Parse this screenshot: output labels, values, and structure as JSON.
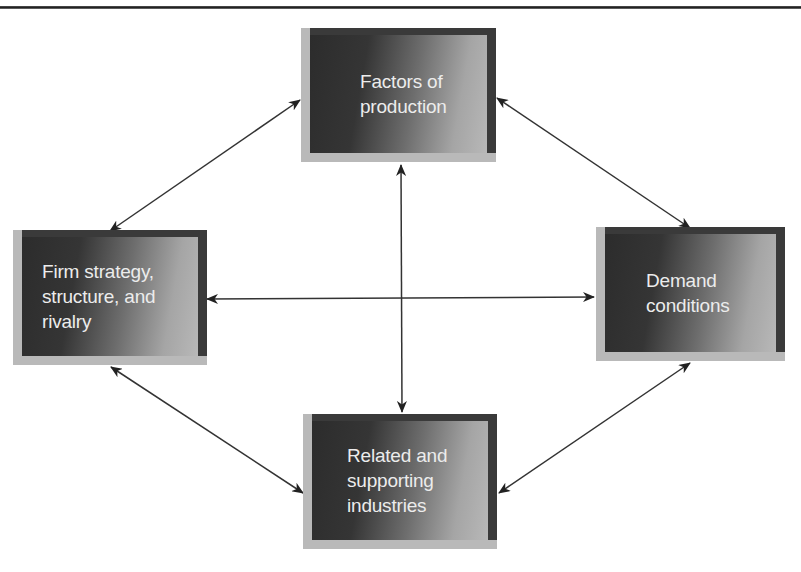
{
  "diagram": {
    "type": "porter-diamond",
    "nodes": [
      {
        "id": "factors",
        "label": "Factors of\nproduction"
      },
      {
        "id": "firm",
        "label": "Firm strategy,\nstructure, and\nrivalry"
      },
      {
        "id": "demand",
        "label": "Demand\nconditions"
      },
      {
        "id": "related",
        "label": "Related and\nsupporting\nindustries"
      }
    ],
    "edges": [
      {
        "from": "factors",
        "to": "firm",
        "bidirectional": true
      },
      {
        "from": "factors",
        "to": "demand",
        "bidirectional": true
      },
      {
        "from": "factors",
        "to": "related",
        "bidirectional": true
      },
      {
        "from": "firm",
        "to": "demand",
        "bidirectional": true
      },
      {
        "from": "firm",
        "to": "related",
        "bidirectional": true
      },
      {
        "from": "demand",
        "to": "related",
        "bidirectional": true
      }
    ]
  },
  "colors": {
    "frame_light": "#b9b9b9",
    "frame_dark": "#3a3a3a",
    "panel_dark": "#2c2c2c",
    "panel_light": "#b8b8b8",
    "text": "#ececec",
    "arrow": "#222222"
  }
}
